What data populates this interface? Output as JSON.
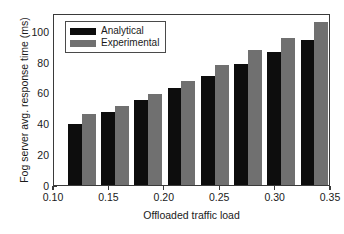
{
  "chart_data": {
    "type": "bar",
    "title": "",
    "xlabel": "Offloaded traffic load",
    "ylabel": "Fog server avg. response time (ms)",
    "x": [
      0.125,
      0.155,
      0.185,
      0.215,
      0.245,
      0.275,
      0.305,
      0.335
    ],
    "categories": [
      "0.125",
      "0.155",
      "0.185",
      "0.215",
      "0.245",
      "0.275",
      "0.305",
      "0.335"
    ],
    "series": [
      {
        "name": "Analytical",
        "color": "#0d0d0d",
        "values": [
          40,
          47.5,
          55.5,
          63,
          71,
          78.5,
          86.5,
          94.5
        ]
      },
      {
        "name": "Experimental",
        "color": "#707070",
        "values": [
          46,
          51.5,
          59,
          68,
          78,
          88,
          96,
          106
        ]
      }
    ],
    "xlim": [
      0.1,
      0.35
    ],
    "ylim": [
      0,
      112
    ],
    "xticks": [
      0.1,
      0.15,
      0.2,
      0.25,
      0.3,
      0.35
    ],
    "xtick_labels": [
      "0.10",
      "0.15",
      "0.20",
      "0.25",
      "0.30",
      "0.35"
    ],
    "yticks": [
      0,
      20,
      40,
      60,
      80,
      100
    ],
    "ytick_labels": [
      "0",
      "20",
      "40",
      "60",
      "80",
      "100"
    ],
    "grid": false,
    "legend_position": "top-left",
    "bar_width": 0.0125
  },
  "legend": {
    "entries": [
      {
        "label": "Analytical",
        "swatch": "#0d0d0d"
      },
      {
        "label": "Experimental",
        "swatch": "#707070"
      }
    ]
  }
}
